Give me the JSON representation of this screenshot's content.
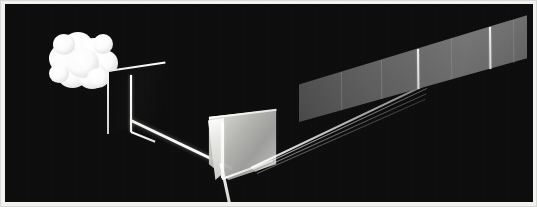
{
  "figure": {
    "title": "Prism dispersion of white light",
    "background_color": "#0d0c0d",
    "border_color": "#d9d9d5",
    "width": 537,
    "height": 207
  },
  "elements": {
    "light_source": {
      "name": "cloud light source",
      "color": "#ffffff",
      "lobe_count": 11
    },
    "slit_panel": {
      "name": "aperture plate with single slit",
      "face_color": "#101011",
      "edge_color": "#f4f4f2",
      "aperture_color": "#ffffff"
    },
    "incident_beam": {
      "name": "incident white light beam",
      "color": "#ffffff",
      "angle_deg": 25.5
    },
    "prism": {
      "name": "triangular glass prism",
      "body_color": "#b8b8b5",
      "highlight_color": "#ffffff"
    },
    "exit_beam_down": {
      "name": "downward transmitted beam",
      "color": "#ffffff",
      "angle_deg": 78
    },
    "dispersion_fan": {
      "name": "refracted dispersed ray fan",
      "ray_count": 4,
      "color": "#ffffff",
      "angle_deg": -25.5
    },
    "spectrum_screen": {
      "name": "spectrum projection screen",
      "band_color": "#6b6b6b",
      "line_color": "#f6f6f4"
    }
  },
  "chart_data": {
    "type": "line",
    "title": "Prism dispersion of white light",
    "xlabel": "",
    "ylabel": "",
    "spectral_lines": [
      {
        "label": "line-1",
        "x_px": 42,
        "brightness": 0.55,
        "kind": "dim"
      },
      {
        "label": "line-2",
        "x_px": 82,
        "brightness": 0.6,
        "kind": "dim"
      },
      {
        "label": "line-3",
        "x_px": 118,
        "brightness": 0.95,
        "kind": "bright"
      },
      {
        "label": "line-4",
        "x_px": 152,
        "brightness": 0.58,
        "kind": "dim"
      },
      {
        "label": "line-5",
        "x_px": 190,
        "brightness": 0.95,
        "kind": "bright"
      },
      {
        "label": "line-6",
        "x_px": 214,
        "brightness": 0.62,
        "kind": "dim"
      }
    ],
    "grid": false,
    "legend": "none"
  }
}
